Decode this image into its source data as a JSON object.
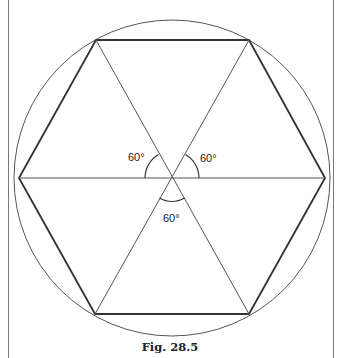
{
  "figure": {
    "caption": "Fig. 28.5",
    "angle_labels": [
      "60°",
      "60°",
      "60°"
    ],
    "colors": {
      "line": "#333333",
      "circle": "#555555",
      "frame": "#7a7a7a"
    }
  }
}
